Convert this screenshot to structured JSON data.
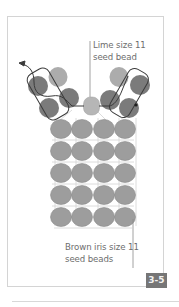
{
  "figure": {
    "number_badge": "3-5",
    "labels": {
      "lime": "Lime size 11\nseed bead",
      "lime_line1": "Lime size 11",
      "lime_line2": "seed bead",
      "brown_line1": "Brown iris size 11",
      "brown_line2": "seed beads"
    },
    "colors": {
      "dark_bead": "#7a7a7a",
      "light_bead": "#a9a9a9",
      "brown_bead": "#9c9c9c",
      "lime_bead": "#b4b4b4",
      "thread": "#3a3a3a",
      "grid_thread": "#d0d0d0",
      "frame": "#d4d4d4",
      "badge_bg": "#767676"
    },
    "grid": {
      "rows": 5,
      "cols": 4,
      "col_centers": [
        61,
        82,
        104,
        125
      ],
      "row_centers": [
        129,
        151,
        173,
        195,
        217
      ]
    }
  }
}
